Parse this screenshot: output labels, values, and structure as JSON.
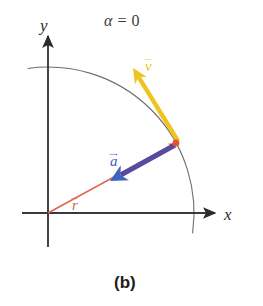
{
  "figure": {
    "caption": "(b)",
    "title_symbol": "α",
    "title_relation": "=",
    "title_value": "0"
  },
  "axes": {
    "x_label": "x",
    "y_label": "y",
    "origin": {
      "x": 48,
      "y": 213
    },
    "x_axis_end": {
      "x": 215,
      "y": 213
    },
    "y_axis_end": {
      "x": 48,
      "y": 36
    },
    "color": "#3a3a3a"
  },
  "arc": {
    "name": "circular-path-arc",
    "center": {
      "x": 48,
      "y": 213
    },
    "radius": 146,
    "start_angle_deg": 98,
    "end_angle_deg": -8,
    "color": "#6e6e6e"
  },
  "particle": {
    "name": "particle-point",
    "x": 176,
    "y": 143,
    "color": "#e8542a",
    "angle_deg": 29
  },
  "vectors": [
    {
      "id": "r",
      "label": "r",
      "name": "radius-vector",
      "color": "#e0614b",
      "tail": {
        "x": 48,
        "y": 213
      },
      "tip": {
        "x": 176,
        "y": 143
      },
      "label_pos": {
        "x": 72,
        "y": 168
      },
      "description": "position vector from origin to particle"
    },
    {
      "id": "a",
      "label": "a",
      "name": "acceleration-vector",
      "color": "#5a4a9f",
      "head_color": "#3f63bf",
      "tail": {
        "x": 175,
        "y": 145
      },
      "tip": {
        "x": 110,
        "y": 181
      },
      "label_pos": {
        "x": 110,
        "y": 139
      },
      "description": "centripetal acceleration pointing toward origin"
    },
    {
      "id": "v",
      "label": "v",
      "name": "velocity-vector",
      "color": "#f0c420",
      "tail": {
        "x": 178,
        "y": 141
      },
      "tip": {
        "x": 133,
        "y": 68
      },
      "label_pos": {
        "x": 145,
        "y": 59
      },
      "description": "tangential velocity vector"
    }
  ],
  "chart_data": {
    "type": "scatter",
    "xlabel": "x",
    "ylabel": "y",
    "grid": false,
    "legend": "none",
    "annotations": [
      "α = 0",
      "(b)",
      "r",
      "a",
      "v"
    ],
    "series": [
      {
        "name": "circular path",
        "kind": "arc",
        "center": [
          0,
          0
        ],
        "radius": 1.0,
        "angle_range_deg": [
          -8,
          98
        ]
      },
      {
        "name": "position vector r",
        "kind": "vector",
        "from": [
          0,
          0
        ],
        "to": [
          0.875,
          0.479
        ],
        "color": "#e0614b"
      },
      {
        "name": "acceleration vector a",
        "kind": "vector",
        "from": [
          0.87,
          0.466
        ],
        "to": [
          0.425,
          0.219
        ],
        "color": "#5a4a9f"
      },
      {
        "name": "velocity vector v",
        "kind": "vector",
        "from": [
          0.89,
          0.493
        ],
        "to": [
          0.582,
          0.993
        ],
        "color": "#f0c420"
      }
    ],
    "xlim": [
      -0.25,
      1.2
    ],
    "ylim": [
      -0.15,
      1.25
    ]
  }
}
